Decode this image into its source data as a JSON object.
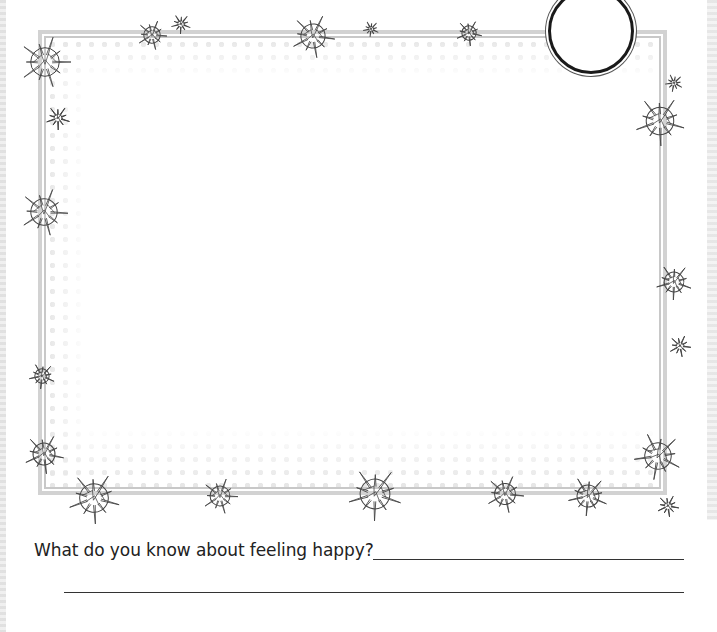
{
  "worksheet": {
    "question_label": "What do you know about feeling happy?",
    "answer_line_1": "",
    "answer_line_2": ""
  },
  "decorations": {
    "frame": "double-line-border",
    "badge": "empty-circle",
    "stars": [
      {
        "x": 45,
        "y": 62,
        "r": 26,
        "kind": "large"
      },
      {
        "x": 58,
        "y": 118,
        "r": 12,
        "kind": "small"
      },
      {
        "x": 152,
        "y": 35,
        "r": 15,
        "kind": "medium"
      },
      {
        "x": 181,
        "y": 24,
        "r": 10,
        "kind": "small"
      },
      {
        "x": 313,
        "y": 36,
        "r": 22,
        "kind": "large"
      },
      {
        "x": 371,
        "y": 29,
        "r": 8,
        "kind": "small"
      },
      {
        "x": 469,
        "y": 33,
        "r": 13,
        "kind": "medium"
      },
      {
        "x": 674,
        "y": 83,
        "r": 9,
        "kind": "small"
      },
      {
        "x": 660,
        "y": 121,
        "r": 25,
        "kind": "large"
      },
      {
        "x": 44,
        "y": 212,
        "r": 24,
        "kind": "large"
      },
      {
        "x": 674,
        "y": 282,
        "r": 18,
        "kind": "medium"
      },
      {
        "x": 680,
        "y": 346,
        "r": 11,
        "kind": "small"
      },
      {
        "x": 42,
        "y": 376,
        "r": 13,
        "kind": "medium"
      },
      {
        "x": 44,
        "y": 454,
        "r": 20,
        "kind": "large"
      },
      {
        "x": 658,
        "y": 456,
        "r": 24,
        "kind": "large"
      },
      {
        "x": 94,
        "y": 498,
        "r": 26,
        "kind": "large"
      },
      {
        "x": 220,
        "y": 496,
        "r": 18,
        "kind": "medium"
      },
      {
        "x": 375,
        "y": 494,
        "r": 27,
        "kind": "large"
      },
      {
        "x": 505,
        "y": 494,
        "r": 19,
        "kind": "medium"
      },
      {
        "x": 588,
        "y": 496,
        "r": 20,
        "kind": "medium"
      },
      {
        "x": 668,
        "y": 506,
        "r": 11,
        "kind": "small"
      }
    ]
  },
  "colors": {
    "text": "#222222",
    "frame": "#c8c8c8",
    "star_stroke": "#444444"
  }
}
